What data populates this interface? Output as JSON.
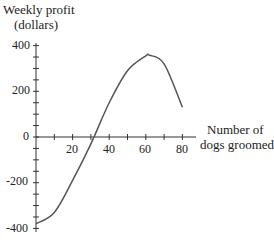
{
  "chart_data": {
    "type": "line",
    "title": "",
    "ylabel": "Weekly profit (dollars)",
    "ylabel_lines": [
      "Weekly profit",
      "(dollars)"
    ],
    "xlabel": "Number of dogs groomed",
    "xlabel_lines": [
      "Number of",
      "dogs groomed"
    ],
    "xlim": [
      0,
      85
    ],
    "ylim": [
      -400,
      400
    ],
    "x_ticks": [
      "20",
      "40",
      "60",
      "80"
    ],
    "y_ticks": [
      "400",
      "200",
      "0",
      "-200",
      "-400"
    ],
    "grid": false,
    "series": [
      {
        "name": "Weekly profit",
        "x": [
          0,
          10,
          20,
          30,
          40,
          50,
          60,
          62,
          70,
          80
        ],
        "y": [
          -380,
          -330,
          -190,
          -30,
          150,
          290,
          355,
          358,
          320,
          130
        ]
      }
    ]
  }
}
